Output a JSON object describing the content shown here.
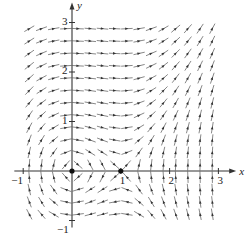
{
  "chart_data": {
    "type": "vector_field",
    "title": "",
    "xlabel": "x",
    "ylabel": "y",
    "system": {
      "dx": "y",
      "dy": "x^2 - x"
    },
    "xlim": [
      -1.1,
      3.2
    ],
    "ylim": [
      -1.1,
      3.2
    ],
    "grid": false,
    "x_ticks": [
      {
        "value": -1,
        "label": "−1"
      },
      {
        "value": 1,
        "label": "1"
      },
      {
        "value": 2,
        "label": "2"
      },
      {
        "value": 3,
        "label": "3"
      }
    ],
    "y_ticks": [
      {
        "value": -1,
        "label": "−1"
      },
      {
        "value": 1,
        "label": "1"
      },
      {
        "value": 2,
        "label": "2"
      },
      {
        "value": 3,
        "label": "3"
      }
    ],
    "equilibria": [
      {
        "x": 0,
        "y": 0
      },
      {
        "x": 1,
        "y": 0
      }
    ],
    "arrow_grid": {
      "x_start": -0.875,
      "x_end": 3.0,
      "y_start": -0.875,
      "y_end": 3.0,
      "step": 0.25
    },
    "colors": {
      "axis": "#333333",
      "arrow": "#555555",
      "dot": "#111111"
    }
  },
  "layout": {
    "origin_px": [
      72,
      171
    ],
    "px_per_unit_x": 48.8,
    "px_per_unit_y": 49.5
  }
}
